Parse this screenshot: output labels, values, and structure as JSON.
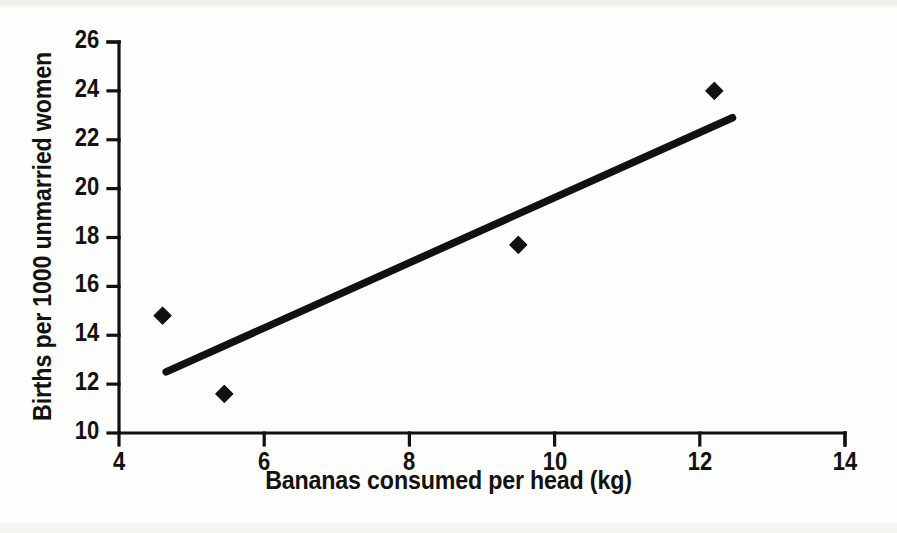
{
  "chart_data": {
    "type": "scatter",
    "title": "",
    "subtitle": "",
    "xlabel": "Bananas consumed per head (kg)",
    "ylabel": "Births per 1000 unmarried women",
    "xlim": [
      4,
      14
    ],
    "ylim": [
      10,
      26
    ],
    "xticks": [
      4,
      6,
      8,
      10,
      12,
      14
    ],
    "yticks": [
      10,
      12,
      14,
      16,
      18,
      20,
      22,
      24,
      26
    ],
    "xtick_labels": [
      "4",
      "6",
      "8",
      "10",
      "12",
      "14"
    ],
    "ytick_labels": [
      "10",
      "12",
      "14",
      "16",
      "18",
      "20",
      "22",
      "24",
      "26"
    ],
    "grid": false,
    "legend": false,
    "legend_position": "none",
    "marker": "diamond",
    "marker_color": "#111111",
    "line_color": "#111111",
    "axis_color": "#111111",
    "background_color": "#ffffff",
    "series": [
      {
        "name": "Observations",
        "type": "scatter",
        "points": [
          {
            "x": 4.6,
            "y": 14.8
          },
          {
            "x": 5.45,
            "y": 11.6
          },
          {
            "x": 9.5,
            "y": 17.7
          },
          {
            "x": 12.2,
            "y": 24.0
          }
        ]
      },
      {
        "name": "Fitted trend line",
        "type": "line",
        "points": [
          {
            "x": 4.65,
            "y": 12.5
          },
          {
            "x": 12.45,
            "y": 22.9
          }
        ]
      }
    ],
    "annotations": []
  }
}
